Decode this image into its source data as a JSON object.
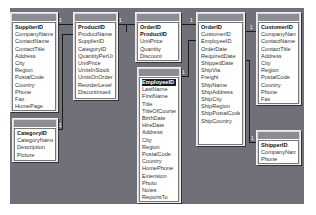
{
  "diagram": {
    "tables": {
      "suppliers": {
        "name": "Suppliers",
        "fields": [
          "SupplierID",
          "CompanyName",
          "ContactName",
          "ContactTitle",
          "Address",
          "City",
          "Region",
          "PostalCode",
          "Country",
          "Phone",
          "Fax",
          "HomePage"
        ]
      },
      "categories": {
        "name": "Categories",
        "fields": [
          "CategoryID",
          "CategoryName",
          "Description",
          "Picture"
        ]
      },
      "products": {
        "name": "Products",
        "fields": [
          "ProductID",
          "ProductName",
          "SupplierID",
          "CategoryID",
          "QuantityPerUnit",
          "UnitPrice",
          "UnitsInStock",
          "UnitsOnOrder",
          "ReorderLevel",
          "Discontinued"
        ]
      },
      "order_details": {
        "name": "Order Details",
        "fields": [
          "OrderID",
          "ProductID",
          "UnitPrice",
          "Quantity",
          "Discount"
        ]
      },
      "employees": {
        "name": "Employees",
        "fields": [
          "EmployeeID",
          "LastName",
          "FirstName",
          "Title",
          "TitleOfCourtesy",
          "BirthDate",
          "HireDate",
          "Address",
          "City",
          "Region",
          "PostalCode",
          "Country",
          "HomePhone",
          "Extension",
          "Photo",
          "Notes",
          "ReportsTo"
        ]
      },
      "orders": {
        "name": "Orders",
        "fields": [
          "OrderID",
          "CustomerID",
          "EmployeeID",
          "OrderDate",
          "RequiredDate",
          "ShippedDate",
          "ShipVia",
          "Freight",
          "ShipName",
          "ShipAddress",
          "ShipCity",
          "ShipRegion",
          "ShipPostalCode",
          "ShipCountry"
        ]
      },
      "customers": {
        "name": "Customers",
        "fields": [
          "CustomerID",
          "CompanyName",
          "ContactName",
          "ContactTitle",
          "Address",
          "City",
          "Region",
          "PostalCode",
          "Country",
          "Phone",
          "Fax"
        ]
      },
      "shippers": {
        "name": "Shippers",
        "fields": [
          "ShipperID",
          "CompanyName",
          "Phone"
        ]
      }
    },
    "relationship_marks": {
      "one": "1",
      "many": "∞"
    },
    "colors": {
      "canvas": "#6f7078",
      "title_bar": "#8c8c94",
      "selected_row": "#1a1a1a"
    }
  }
}
